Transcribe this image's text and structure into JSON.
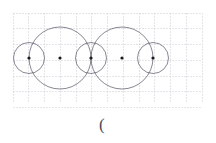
{
  "page": {
    "width": 216,
    "height": 143,
    "background": "#ffffff"
  },
  "grid": {
    "x": 13,
    "y": 13,
    "width": 189,
    "height": 90,
    "cell": 15.75,
    "columns": 12,
    "rows": 6,
    "color": "#c9c9d4",
    "style": "dashed",
    "visible": true
  },
  "figure": {
    "stroke_color": "#555566",
    "dot_color": "#1a1a1a",
    "axis_y": 58,
    "centers": [
      {
        "name": "point-a",
        "x": 29,
        "y": 58
      },
      {
        "name": "point-b",
        "x": 60,
        "y": 58
      },
      {
        "name": "point-c",
        "x": 91,
        "y": 58
      },
      {
        "name": "point-d",
        "x": 122,
        "y": 58
      },
      {
        "name": "point-e",
        "x": 153,
        "y": 58
      }
    ],
    "dot_radius": 1.6,
    "circles": [
      {
        "name": "small-circle-left",
        "cx": 29,
        "cy": 58,
        "r": 15.5,
        "size": "small"
      },
      {
        "name": "large-circle-left",
        "cx": 60,
        "cy": 58,
        "r": 31,
        "size": "large"
      },
      {
        "name": "small-circle-middle",
        "cx": 91,
        "cy": 58,
        "r": 15.5,
        "size": "small"
      },
      {
        "name": "large-circle-right",
        "cx": 122,
        "cy": 58,
        "r": 31,
        "size": "large"
      },
      {
        "name": "small-circle-right",
        "cx": 153,
        "cy": 58,
        "r": 15.5,
        "size": "small"
      }
    ]
  },
  "caption": {
    "text": "(",
    "x": 99,
    "y": 116,
    "color": "#4a4a55"
  }
}
